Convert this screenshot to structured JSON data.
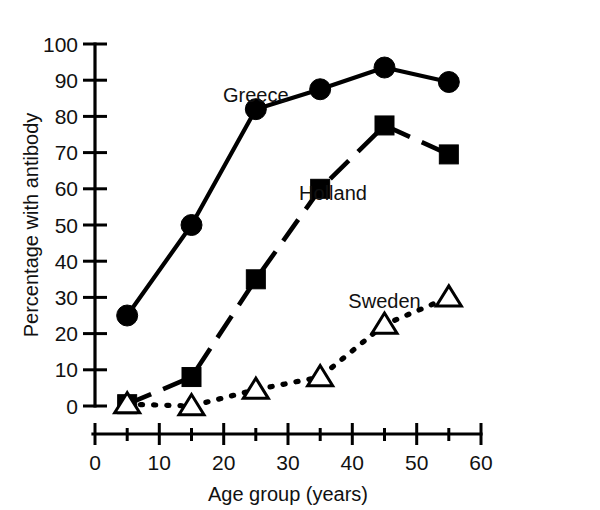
{
  "chart_data": {
    "type": "line",
    "title": "",
    "subtitle": "",
    "xlabel": "Age group (years)",
    "ylabel": "Percentage with antibody",
    "xlim": [
      0,
      60
    ],
    "ylim": [
      0,
      100
    ],
    "x_ticks_major": [
      0,
      10,
      20,
      30,
      40,
      50,
      60
    ],
    "x_ticks_minor": [
      5,
      15,
      25,
      35,
      45,
      55
    ],
    "x_tick_labels": [
      "0",
      "10",
      "20",
      "30",
      "40",
      "50",
      "60"
    ],
    "y_ticks_major": [
      0,
      10,
      20,
      30,
      40,
      50,
      60,
      70,
      80,
      90,
      100
    ],
    "y_tick_labels": [
      "0",
      "10",
      "20",
      "30",
      "40",
      "50",
      "60",
      "70",
      "80",
      "90",
      "100"
    ],
    "grid": false,
    "legend_position": "inline-annotations",
    "x": [
      5,
      15,
      25,
      35,
      45,
      55
    ],
    "series": [
      {
        "name": "Greece",
        "marker": "filled-circle",
        "line_style": "solid",
        "color": "#000000",
        "values": [
          25,
          50,
          82,
          87.5,
          93.5,
          89.5
        ],
        "label_x": 25,
        "label_y": 84
      },
      {
        "name": "Holland",
        "marker": "filled-square",
        "line_style": "dashed",
        "color": "#000000",
        "values": [
          0.5,
          8,
          35,
          60,
          77.5,
          69.5
        ],
        "label_x": 37,
        "label_y": 57
      },
      {
        "name": "Sweden",
        "marker": "open-triangle",
        "line_style": "dotted",
        "color": "#000000",
        "values": [
          0.5,
          0,
          4.5,
          8,
          22.5,
          30
        ],
        "label_x": 45,
        "label_y": 27
      }
    ]
  },
  "axes": {
    "y_axis_title": "Percentage with antibody",
    "x_axis_title": "Age group (years)"
  },
  "annotations": {
    "greece": "Greece",
    "holland": "Holland",
    "sweden": "Sweden"
  }
}
